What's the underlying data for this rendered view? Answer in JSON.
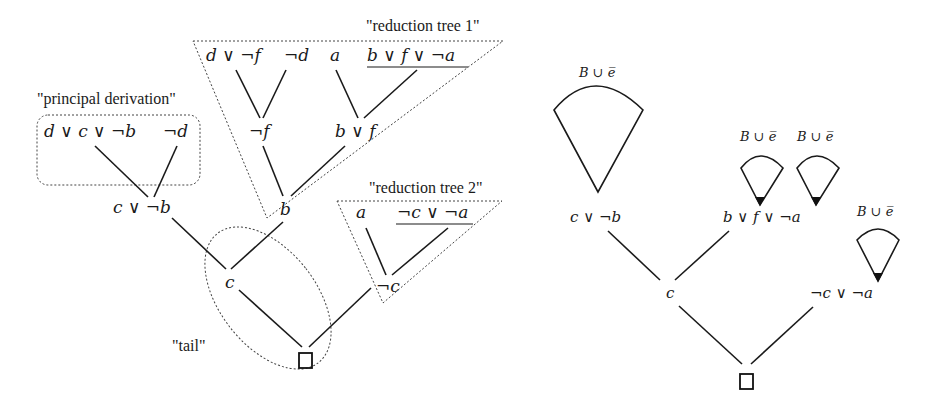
{
  "left_diagram": {
    "captions": {
      "principal_derivation": "\"principal derivation\"",
      "reduction_tree_1": "\"reduction tree 1\"",
      "reduction_tree_2": "\"reduction tree 2\"",
      "tail": "\"tail\""
    },
    "principal": {
      "leaf1": "d ∨ c ∨ ¬b",
      "leaf2": "¬d",
      "result": "c ∨ ¬b"
    },
    "reduction1": {
      "leaf1": "d ∨ ¬f",
      "leaf2": "¬d",
      "leaf3": "a",
      "leaf4": "b ∨ f ∨ ¬a",
      "mid1": "¬f",
      "mid2": "b ∨ f",
      "result": "b"
    },
    "reduction2": {
      "leaf1": "a",
      "leaf2": "¬c ∨ ¬a",
      "result": "¬c"
    },
    "tail": {
      "node": "c",
      "empty_clause": "□"
    }
  },
  "right_diagram": {
    "nodes": {
      "n1": "c ∨ ¬b",
      "n2": "b ∨ f ∨ ¬a",
      "n3": "c",
      "n4": "¬c ∨ ¬a",
      "empty_clause": "□"
    },
    "cone_label": "B ∪ e̅",
    "cones": [
      {
        "label": "B ∪ e̅",
        "attached_to": "c ∨ ¬b",
        "size": "large"
      },
      {
        "label": "B ∪ e̅",
        "attached_to": "b ∨ f ∨ ¬a",
        "size": "small"
      },
      {
        "label": "B ∪ e̅",
        "attached_to": "b ∨ f ∨ ¬a",
        "size": "small"
      },
      {
        "label": "B ∪ e̅",
        "attached_to": "¬c ∨ ¬a",
        "size": "small"
      }
    ]
  }
}
